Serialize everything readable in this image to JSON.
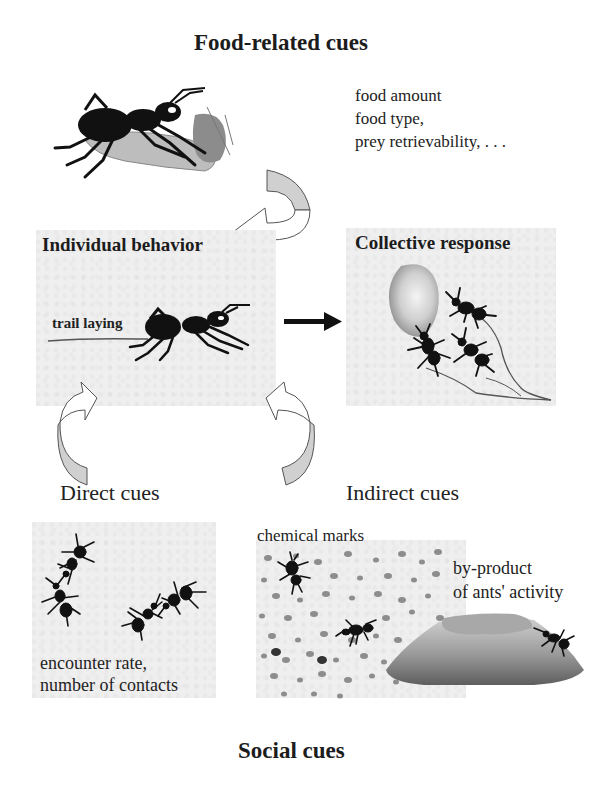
{
  "diagram": {
    "top_title": "Food-related cues",
    "bottom_title": "Social cues",
    "food_cues": {
      "lines": [
        "food amount",
        "food type,",
        "prey retrievability, . . ."
      ]
    },
    "individual_behavior": {
      "title": "Individual behavior",
      "annotation": "trail laying"
    },
    "collective_response": {
      "title": "Collective response"
    },
    "direct_cues": {
      "label": "Direct cues",
      "caption_lines": [
        "encounter rate,",
        "number of contacts"
      ]
    },
    "indirect_cues": {
      "label": "Indirect cues",
      "chemical_label": "chemical marks",
      "byproduct_lines": [
        "by-product",
        "of ants' activity"
      ]
    },
    "colors": {
      "panel_bg": "#efefef",
      "arrow_fill": "#d0d0d0",
      "ant": "#111111",
      "food_item": "#bdbdbd",
      "mound_dark": "#6a6a6a",
      "mound_light": "#c8c8c8"
    },
    "arrows": [
      {
        "name": "food-to-individual",
        "type": "curved"
      },
      {
        "name": "individual-to-collective",
        "type": "straight"
      },
      {
        "name": "direct-to-individual",
        "type": "curved"
      },
      {
        "name": "indirect-to-individual",
        "type": "curved"
      }
    ]
  }
}
